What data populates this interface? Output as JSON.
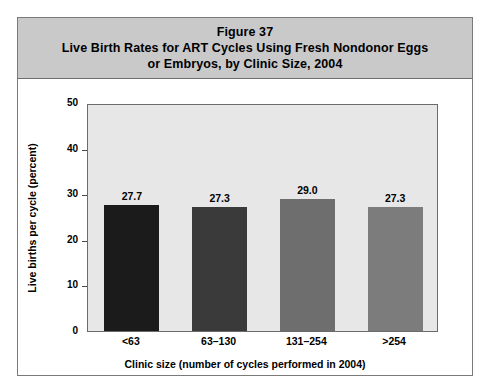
{
  "figure": {
    "title_lines": [
      "Figure 37",
      "Live Birth Rates for ART Cycles Using Fresh Nondonor Eggs",
      "or Embryos, by Clinic Size, 2004"
    ],
    "header_bg": "#c9c9c9",
    "frame_border": "#7a7a7a",
    "plot_bg": "#e7e7e7"
  },
  "chart_data": {
    "type": "bar",
    "title": "Live Birth Rates for ART Cycles Using Fresh Nondonor Eggs or Embryos, by Clinic Size, 2004",
    "categories": [
      "<63",
      "63–130",
      "131–254",
      ">254"
    ],
    "values": [
      27.7,
      27.3,
      29.0,
      27.3
    ],
    "value_labels": [
      "27.7",
      "27.3",
      "29.0",
      "27.3"
    ],
    "bar_colors": [
      "#1b1b1b",
      "#3a3a3a",
      "#6e6e6e",
      "#7c7c7c"
    ],
    "xlabel": "Clinic size (number of cycles performed in 2004)",
    "ylabel": "Live births per cycle (percent)",
    "ylim": [
      0,
      50
    ],
    "yticks": [
      0,
      10,
      20,
      30,
      40,
      50
    ],
    "ytick_labels": [
      "0",
      "10",
      "20",
      "30",
      "40",
      "50"
    ],
    "grid": false,
    "legend": false
  }
}
